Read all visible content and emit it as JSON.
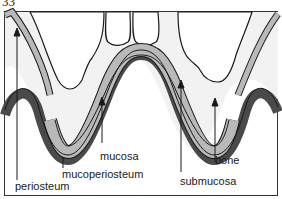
{
  "figure": {
    "number": "33",
    "colors": {
      "background": "#ffffff",
      "bone": "#f2f2f2",
      "mucosa": "#b9b9b9",
      "submucosa": "#a6a6a6",
      "periosteum": "#4a4a4a",
      "outline": "#1a1a1a"
    }
  },
  "labels": {
    "periosteum": "periosteum",
    "mucoperiosteum": "mucoperiosteum",
    "mucosa": "mucosa",
    "submucosa": "submucosa",
    "bone": "bone"
  }
}
